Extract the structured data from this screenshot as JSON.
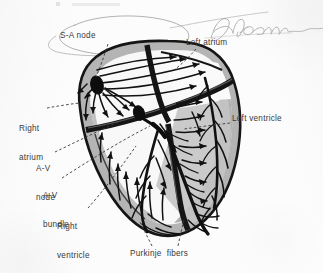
{
  "figure": {
    "medium": "scanned textbook illustration with pencil annotations",
    "background_color": "#fcfcfc",
    "ink_color": "#1a1a1a",
    "wall_shading_color": "#b8b8b8",
    "chamber_fill_color": "#f7f7f7",
    "label_color": "#3a3a3a",
    "pencil_color": "#9a9a9e"
  },
  "labels": {
    "sa_node": "S-A node",
    "left_atrium": "Left atrium",
    "right_atrium_line1": "Right",
    "right_atrium_line2": "atrium",
    "left_ventricle": "Left ventricle",
    "av_node_line1": "A-V",
    "av_node_line2": "node",
    "av_bundle_line1": "A-V",
    "av_bundle_line2": "bundle",
    "right_ventricle_line1": "Right",
    "right_ventricle_line2": "ventricle",
    "purkinje_fibers": "Purkinje  fibers"
  },
  "annotations": {
    "pencil_ellipse": "hand-drawn ellipse circling the S-A node label",
    "pencil_signature": "cursive pencil signature across top right"
  },
  "structures": [
    {
      "name": "sa-node",
      "type": "pacemaker-node",
      "chamber": "right-atrium"
    },
    {
      "name": "av-node",
      "type": "conduction-node",
      "chamber": "interatrial-septum"
    },
    {
      "name": "av-bundle",
      "type": "bundle-of-his",
      "chamber": "interventricular-septum"
    },
    {
      "name": "right-atrium",
      "type": "chamber"
    },
    {
      "name": "left-atrium",
      "type": "chamber"
    },
    {
      "name": "right-ventricle",
      "type": "chamber"
    },
    {
      "name": "left-ventricle",
      "type": "chamber"
    },
    {
      "name": "purkinje-fibers",
      "type": "terminal-conduction-network"
    }
  ]
}
